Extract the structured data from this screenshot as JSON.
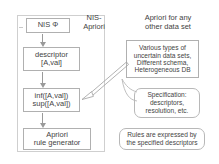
{
  "figure": {
    "title_left": {
      "line1": "NIS-",
      "line2": "Apriori"
    },
    "title_right": {
      "line1": "Apriori for any",
      "line2": "other data set"
    }
  },
  "left_flow": {
    "nodes": [
      {
        "id": "nis",
        "line1": "NIS Φ",
        "line2": ""
      },
      {
        "id": "descriptor",
        "line1": "descriptor",
        "line2": "[A,val]"
      },
      {
        "id": "infsup",
        "line1": "inf([A,val])",
        "line2": "sup([A,val])"
      },
      {
        "id": "generator",
        "line1": "Apriori",
        "line2": "rule generator"
      }
    ]
  },
  "right_side": {
    "data_box": {
      "line1": "Various types of",
      "line2": "uncertain data sets,",
      "line3": "Different schema,",
      "line4": "Heterogeneous DB"
    },
    "spec_bubble": {
      "line1": "Specification:",
      "line2": "descriptors,",
      "line3": "resolution, etc."
    },
    "rules_bubble": {
      "line1": "Rules are expressed by",
      "line2": "the specified descriptors"
    }
  },
  "colors": {
    "box_border": "#b0b0b0",
    "panel_border": "#cfcfcf",
    "arrow": "#9a9a9a",
    "text": "#444444",
    "background": "#ffffff"
  }
}
